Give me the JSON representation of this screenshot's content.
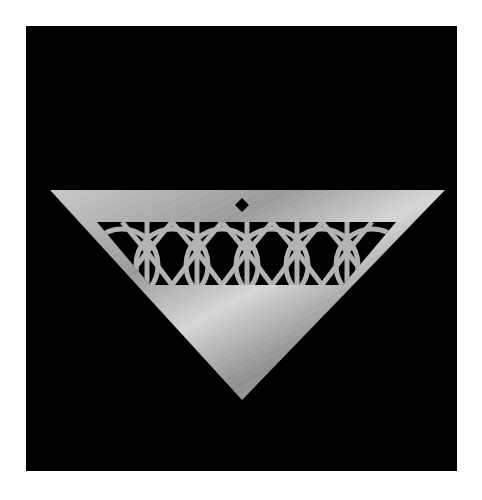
{
  "image": {
    "subject": "Silver triangular pendant with openwork circle-lattice pattern",
    "background_color": "#000000",
    "frame_color": "#ffffff",
    "metal_color": "#b8b8b8"
  }
}
